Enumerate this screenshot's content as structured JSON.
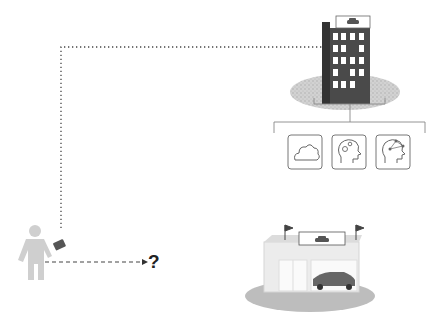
{
  "diagram": {
    "question_mark": "?",
    "nodes": [
      {
        "id": "customer",
        "label": "person-with-wallet"
      },
      {
        "id": "company",
        "label": "office-building-with-car-sign"
      },
      {
        "id": "dealership",
        "label": "car-dealership-store"
      }
    ],
    "services": [
      {
        "id": "cloud",
        "icon": "cloud-icon"
      },
      {
        "id": "ai-brain",
        "icon": "brain-gears-icon"
      },
      {
        "id": "ai-network",
        "icon": "brain-network-icon"
      }
    ],
    "edges": [
      {
        "from": "customer",
        "to": "company",
        "style": "dotted"
      },
      {
        "from": "customer",
        "to": "?",
        "style": "dashed-arrow"
      },
      {
        "from": "company",
        "to": "services",
        "style": "tree"
      }
    ],
    "colors": {
      "building": "#4a4a4a",
      "building_side": "#3a3a3a",
      "person": "#cfcfcf",
      "wallet": "#555555",
      "ground": "#c8c8c8",
      "icon_border": "#777777"
    }
  }
}
